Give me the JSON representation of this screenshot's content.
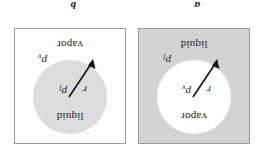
{
  "figure": {
    "panels": [
      {
        "caption": "a",
        "description": "vapor bubble inside liquid",
        "inner_phase": "vapor",
        "outer_phase": "liquid",
        "inner_pressure_symbol": "p",
        "inner_pressure_subscript": "v",
        "outer_pressure_symbol": "p",
        "outer_pressure_subscript": "l",
        "radius_symbol": "r",
        "inner_fill": "#ffffff",
        "outer_fill": "#d3d3d3"
      },
      {
        "caption": "b",
        "description": "liquid droplet inside vapor",
        "inner_phase": "liquid",
        "outer_phase": "vapor",
        "inner_pressure_symbol": "p",
        "inner_pressure_subscript": "l",
        "outer_pressure_symbol": "p",
        "outer_pressure_subscript": "v",
        "radius_symbol": "r",
        "inner_fill": "#dcdcdc",
        "outer_fill": "#fdfdfd"
      }
    ],
    "border_color": "#9a9a9a",
    "text_color": "#1a1a1a"
  }
}
